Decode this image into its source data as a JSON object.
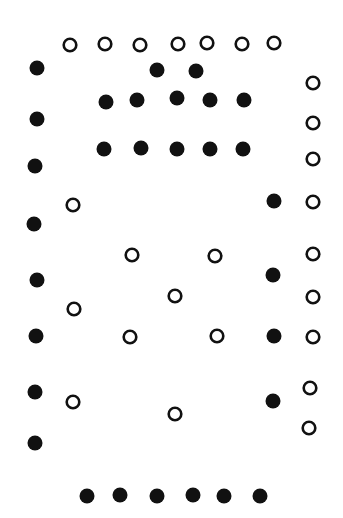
{
  "figure": {
    "ink_color": "#111111",
    "background_color": "#ffffff",
    "counts": {
      "filled": 32,
      "open": 30
    }
  },
  "chart_data": {
    "type": "scatter",
    "title": "",
    "xlabel": "",
    "ylabel": "",
    "grid": false,
    "legend": "none",
    "xlim": [
      0,
      343
    ],
    "ylim": [
      0,
      518
    ],
    "y_direction": "down",
    "series": [
      {
        "name": "filled",
        "marker": "filled-circle",
        "points": [
          [
            37,
            68
          ],
          [
            37,
            119
          ],
          [
            35,
            166
          ],
          [
            34,
            224
          ],
          [
            37,
            280
          ],
          [
            36,
            336
          ],
          [
            35,
            392
          ],
          [
            35,
            443
          ],
          [
            157,
            70
          ],
          [
            196,
            71
          ],
          [
            106,
            102
          ],
          [
            137,
            100
          ],
          [
            177,
            98
          ],
          [
            210,
            100
          ],
          [
            244,
            100
          ],
          [
            104,
            149
          ],
          [
            141,
            148
          ],
          [
            177,
            149
          ],
          [
            210,
            149
          ],
          [
            243,
            149
          ],
          [
            274,
            201
          ],
          [
            273,
            275
          ],
          [
            274,
            336
          ],
          [
            273,
            401
          ],
          [
            87,
            496
          ],
          [
            120,
            495
          ],
          [
            157,
            496
          ],
          [
            193,
            495
          ],
          [
            224,
            496
          ],
          [
            260,
            496
          ]
        ]
      },
      {
        "name": "open",
        "marker": "open-circle",
        "points": [
          [
            70,
            45
          ],
          [
            105,
            44
          ],
          [
            140,
            45
          ],
          [
            178,
            44
          ],
          [
            207,
            43
          ],
          [
            242,
            44
          ],
          [
            274,
            43
          ],
          [
            313,
            83
          ],
          [
            313,
            123
          ],
          [
            313,
            159
          ],
          [
            313,
            202
          ],
          [
            313,
            254
          ],
          [
            313,
            297
          ],
          [
            313,
            337
          ],
          [
            310,
            388
          ],
          [
            309,
            428
          ],
          [
            73,
            205
          ],
          [
            74,
            309
          ],
          [
            73,
            402
          ],
          [
            132,
            255
          ],
          [
            215,
            256
          ],
          [
            175,
            296
          ],
          [
            130,
            337
          ],
          [
            217,
            336
          ],
          [
            175,
            414
          ]
        ]
      }
    ]
  }
}
